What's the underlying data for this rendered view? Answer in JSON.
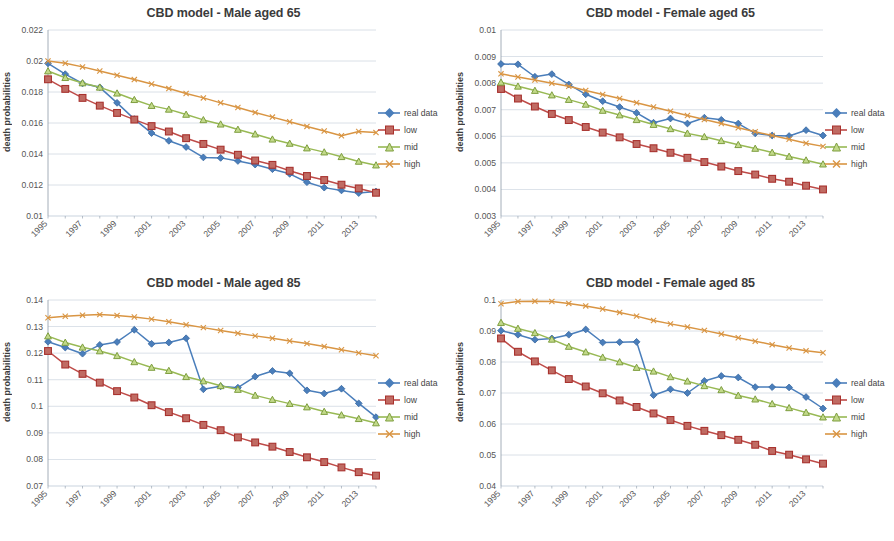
{
  "figure": {
    "ylabel": "death probabilities",
    "series_names": [
      "real data",
      "low",
      "mid",
      "high"
    ],
    "colors": {
      "real data": "#4a7ebb",
      "low": "#be4b48",
      "mid": "#98b954",
      "high": "#d99543",
      "grid": "#c9d3de",
      "axis": "#9aa5b1",
      "text": "#3b3b3b"
    },
    "markers": {
      "real data": "diamond",
      "low": "square",
      "mid": "triangle",
      "high": "cross"
    },
    "legend_position": "right"
  },
  "charts": [
    {
      "id": "male-65",
      "title": "CBD model - Male aged 65",
      "type": "line",
      "xlabel": "",
      "ylabel": "death probabilities",
      "x": [
        1995,
        1996,
        1997,
        1998,
        1999,
        2000,
        2001,
        2002,
        2003,
        2004,
        2005,
        2006,
        2007,
        2008,
        2009,
        2010,
        2011,
        2012,
        2013,
        2014
      ],
      "xtick_labels": [
        "1995",
        "1997",
        "1999",
        "2001",
        "2003",
        "2005",
        "2007",
        "2009",
        "2011",
        "2013"
      ],
      "ytick_labels": [
        "0.01",
        "0.012",
        "0.014",
        "0.016",
        "0.018",
        "0.02",
        "0.022"
      ],
      "ylim": [
        0.01,
        0.022
      ],
      "ystep": 0.002,
      "grid": true,
      "series": [
        {
          "name": "real data",
          "values": [
            0.01985,
            0.01915,
            0.01855,
            0.0183,
            0.0173,
            0.01625,
            0.01535,
            0.01485,
            0.01445,
            0.01378,
            0.01375,
            0.01355,
            0.01332,
            0.01302,
            0.01272,
            0.01218,
            0.01183,
            0.01165,
            0.01148,
            0.01158
          ]
        },
        {
          "name": "low",
          "values": [
            0.01882,
            0.0182,
            0.01762,
            0.01712,
            0.01665,
            0.01622,
            0.0158,
            0.01545,
            0.01502,
            0.01465,
            0.01428,
            0.01395,
            0.01358,
            0.0133,
            0.01292,
            0.01258,
            0.01232,
            0.01202,
            0.01178,
            0.0115
          ]
        },
        {
          "name": "mid",
          "values": [
            0.01935,
            0.01892,
            0.01858,
            0.0183,
            0.01792,
            0.0175,
            0.01712,
            0.01688,
            0.01655,
            0.0162,
            0.01592,
            0.01558,
            0.01528,
            0.01495,
            0.01468,
            0.01438,
            0.01412,
            0.01382,
            0.01352,
            0.01328
          ]
        },
        {
          "name": "high",
          "values": [
            0.02,
            0.01985,
            0.01962,
            0.01935,
            0.01908,
            0.0188,
            0.01852,
            0.01822,
            0.0179,
            0.01762,
            0.0173,
            0.017,
            0.01668,
            0.01638,
            0.01608,
            0.01578,
            0.01548,
            0.01518,
            0.01545,
            0.01538
          ]
        }
      ]
    },
    {
      "id": "female-65",
      "title": "CBD model - Female aged 65",
      "type": "line",
      "xlabel": "",
      "ylabel": "death probabilities",
      "x": [
        1995,
        1996,
        1997,
        1998,
        1999,
        2000,
        2001,
        2002,
        2003,
        2004,
        2005,
        2006,
        2007,
        2008,
        2009,
        2010,
        2011,
        2012,
        2013,
        2014
      ],
      "xtick_labels": [
        "1995",
        "1997",
        "1999",
        "2001",
        "2003",
        "2005",
        "2007",
        "2009",
        "2011",
        "2013"
      ],
      "ytick_labels": [
        "0.003",
        "0.004",
        "0.005",
        "0.006",
        "0.007",
        "0.008",
        "0.009",
        "0.01"
      ],
      "ylim": [
        0.003,
        0.01
      ],
      "ystep": 0.001,
      "grid": true,
      "series": [
        {
          "name": "real data",
          "values": [
            0.00872,
            0.00871,
            0.00824,
            0.00834,
            0.00795,
            0.00758,
            0.00732,
            0.0071,
            0.00688,
            0.00651,
            0.00667,
            0.00648,
            0.0067,
            0.00662,
            0.00648,
            0.00611,
            0.00603,
            0.00601,
            0.00623,
            0.00603
          ]
        },
        {
          "name": "low",
          "values": [
            0.00778,
            0.00742,
            0.00712,
            0.00684,
            0.00661,
            0.00635,
            0.00614,
            0.00596,
            0.00571,
            0.00555,
            0.00538,
            0.00519,
            0.00503,
            0.00486,
            0.00469,
            0.00456,
            0.0044,
            0.00429,
            0.00414,
            0.004
          ]
        },
        {
          "name": "mid",
          "values": [
            0.00803,
            0.00788,
            0.00772,
            0.00755,
            0.00738,
            0.0072,
            0.00697,
            0.0068,
            0.00662,
            0.00644,
            0.00628,
            0.00611,
            0.00598,
            0.00583,
            0.00568,
            0.00554,
            0.00539,
            0.00524,
            0.0051,
            0.00495,
            0.00472
          ]
        },
        {
          "name": "high",
          "values": [
            0.00835,
            0.00823,
            0.00812,
            0.008,
            0.00788,
            0.00772,
            0.00757,
            0.00742,
            0.00726,
            0.0071,
            0.00694,
            0.00678,
            0.00663,
            0.00648,
            0.00632,
            0.00617,
            0.00603,
            0.00589,
            0.00574,
            0.00562
          ]
        }
      ]
    },
    {
      "id": "male-85",
      "title": "CBD model - Male aged 85",
      "type": "line",
      "xlabel": "",
      "ylabel": "death probabilities",
      "x": [
        1995,
        1996,
        1997,
        1998,
        1999,
        2000,
        2001,
        2002,
        2003,
        2004,
        2005,
        2006,
        2007,
        2008,
        2009,
        2010,
        2011,
        2012,
        2013,
        2014
      ],
      "xtick_labels": [
        "1995",
        "1997",
        "1999",
        "2001",
        "2003",
        "2005",
        "2007",
        "2009",
        "2011",
        "2013"
      ],
      "ytick_labels": [
        "0.07",
        "0.08",
        "0.09",
        "0.1",
        "0.11",
        "0.12",
        "0.13",
        "0.14"
      ],
      "ylim": [
        0.07,
        0.14
      ],
      "ystep": 0.01,
      "grid": true,
      "series": [
        {
          "name": "real data",
          "values": [
            0.1243,
            0.1221,
            0.1198,
            0.1231,
            0.1242,
            0.1288,
            0.1235,
            0.124,
            0.1256,
            0.1064,
            0.1075,
            0.107,
            0.1112,
            0.1133,
            0.1124,
            0.106,
            0.1048,
            0.1066,
            0.1011,
            0.0959
          ]
        },
        {
          "name": "low",
          "values": [
            0.1208,
            0.1157,
            0.1122,
            0.1089,
            0.1057,
            0.1033,
            0.1004,
            0.0978,
            0.0955,
            0.093,
            0.091,
            0.0883,
            0.0864,
            0.0848,
            0.0828,
            0.0808,
            0.079,
            0.077,
            0.0752,
            0.0739
          ]
        },
        {
          "name": "mid",
          "values": [
            0.1264,
            0.124,
            0.1222,
            0.1208,
            0.119,
            0.1167,
            0.1146,
            0.1134,
            0.1111,
            0.1095,
            0.1077,
            0.1063,
            0.1041,
            0.1025,
            0.101,
            0.0997,
            0.098,
            0.0967,
            0.0953,
            0.0937
          ]
        },
        {
          "name": "high",
          "values": [
            0.1333,
            0.1339,
            0.1343,
            0.1345,
            0.1342,
            0.1336,
            0.1328,
            0.1318,
            0.1307,
            0.1296,
            0.1285,
            0.1275,
            0.1265,
            0.1256,
            0.1246,
            0.1236,
            0.1225,
            0.1213,
            0.1201,
            0.119
          ]
        }
      ]
    },
    {
      "id": "female-85",
      "title": "CBD model - Female aged 85",
      "type": "line",
      "xlabel": "",
      "ylabel": "death probabilities",
      "x": [
        1995,
        1996,
        1997,
        1998,
        1999,
        2000,
        2001,
        2002,
        2003,
        2004,
        2005,
        2006,
        2007,
        2008,
        2009,
        2010,
        2011,
        2012,
        2013,
        2014
      ],
      "xtick_labels": [
        "1995",
        "1997",
        "1999",
        "2001",
        "2003",
        "2005",
        "2007",
        "2009",
        "2011",
        "2013"
      ],
      "ytick_labels": [
        "0.04",
        "0.05",
        "0.06",
        "0.07",
        "0.08",
        "0.09",
        "0.1"
      ],
      "ylim": [
        0.04,
        0.1
      ],
      "ystep": 0.01,
      "grid": true,
      "series": [
        {
          "name": "real data",
          "values": [
            0.0901,
            0.0888,
            0.0872,
            0.0876,
            0.0888,
            0.0905,
            0.0863,
            0.0864,
            0.0865,
            0.0693,
            0.0712,
            0.07,
            0.0739,
            0.0755,
            0.075,
            0.0719,
            0.0719,
            0.0718,
            0.0687,
            0.065
          ]
        },
        {
          "name": "low",
          "values": [
            0.0876,
            0.0833,
            0.0802,
            0.0773,
            0.0745,
            0.0721,
            0.0699,
            0.0676,
            0.0655,
            0.0634,
            0.0613,
            0.0594,
            0.0578,
            0.0564,
            0.0549,
            0.0533,
            0.0513,
            0.0501,
            0.0486,
            0.0472
          ]
        },
        {
          "name": "mid",
          "values": [
            0.0927,
            0.0908,
            0.0894,
            0.0873,
            0.085,
            0.0832,
            0.0815,
            0.08,
            0.0782,
            0.077,
            0.0752,
            0.0738,
            0.0723,
            0.071,
            0.0692,
            0.068,
            0.0665,
            0.0652,
            0.0637,
            0.0622
          ]
        },
        {
          "name": "high",
          "values": [
            0.0988,
            0.0995,
            0.0996,
            0.0995,
            0.0989,
            0.0981,
            0.0971,
            0.096,
            0.0948,
            0.0934,
            0.0923,
            0.0913,
            0.0902,
            0.089,
            0.0878,
            0.0867,
            0.0856,
            0.0845,
            0.0836,
            0.083
          ]
        }
      ]
    }
  ],
  "chart_data": {
    "type": "line",
    "panels": [
      "CBD model - Male aged 65",
      "CBD model - Female aged 65",
      "CBD model - Male aged 85",
      "CBD model - Female aged 85"
    ],
    "series_names": [
      "real data",
      "low",
      "mid",
      "high"
    ],
    "xlabel": "",
    "ylabel": "death probabilities",
    "x": [
      1995,
      1996,
      1997,
      1998,
      1999,
      2000,
      2001,
      2002,
      2003,
      2004,
      2005,
      2006,
      2007,
      2008,
      2009,
      2010,
      2011,
      2012,
      2013,
      2014
    ],
    "xtick_labels": [
      "1995",
      "1997",
      "1999",
      "2001",
      "2003",
      "2005",
      "2007",
      "2009",
      "2011",
      "2013"
    ],
    "grid": true,
    "legend_position": "right"
  }
}
